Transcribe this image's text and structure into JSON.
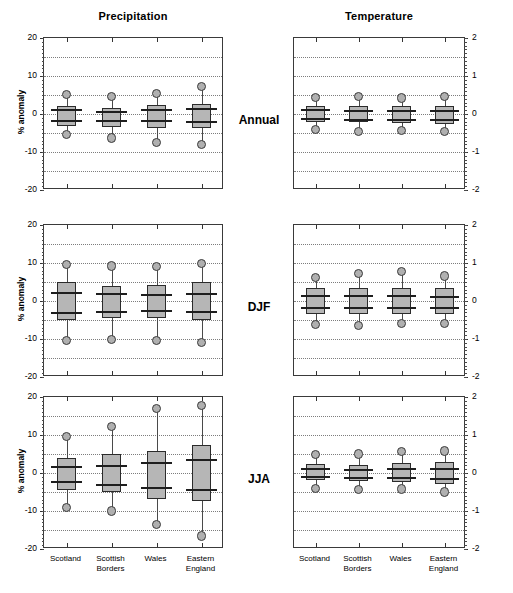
{
  "figure": {
    "columns": [
      {
        "key": "precipitation",
        "title": "Precipitation"
      },
      {
        "key": "temperature",
        "title": "Temperature"
      }
    ],
    "rows": [
      {
        "key": "annual",
        "label": "Annual"
      },
      {
        "key": "djf",
        "label": "DJF"
      },
      {
        "key": "jja",
        "label": "JJA"
      }
    ],
    "categories": [
      "Scotland",
      "Scottish\nBorders",
      "Wales",
      "Eastern\nEngland"
    ],
    "colors": {
      "box_fill": "#b6b6b6",
      "box_edge": "#2b2b2b",
      "bar": "#1e1e1e",
      "whisker": "#4a4a4a",
      "marker_fill": "#b0b0b0",
      "grid": "#7d7d7d",
      "frame": "#3a3a3a"
    }
  },
  "chart_data": [
    {
      "type": "box",
      "panel": "precipitation-annual",
      "title": "Precipitation",
      "row": "Annual",
      "ylabel": "% anomaly",
      "ylim": [
        -20,
        20
      ],
      "yticks": [
        20,
        10,
        0,
        -10,
        -20
      ],
      "ytick_labels": [
        "20",
        "10",
        "0",
        "-10",
        "-20"
      ],
      "gridlines": [
        15,
        10,
        5,
        0,
        -5,
        -10,
        -15
      ],
      "grid": true,
      "categories": [
        "Scotland",
        "Scottish Borders",
        "Wales",
        "Eastern England"
      ],
      "boxes": [
        {
          "category": "Scotland",
          "upper_cap": 5.2,
          "box_top": 2.1,
          "p_upper": 1.3,
          "p_lower": -1.5,
          "box_bottom": -3.2,
          "lower_cap": -5.3
        },
        {
          "category": "Scottish Borders",
          "upper_cap": 4.7,
          "box_top": 1.6,
          "p_upper": 0.9,
          "p_lower": -1.6,
          "box_bottom": -3.4,
          "lower_cap": -6.3
        },
        {
          "category": "Wales",
          "upper_cap": 5.4,
          "box_top": 2.5,
          "p_upper": 1.4,
          "p_lower": -1.6,
          "box_bottom": -3.6,
          "lower_cap": -7.6
        },
        {
          "category": "Eastern England",
          "upper_cap": 7.2,
          "box_top": 2.7,
          "p_upper": 1.6,
          "p_lower": -1.8,
          "box_bottom": -3.6,
          "lower_cap": -8.1
        }
      ]
    },
    {
      "type": "box",
      "panel": "temperature-annual",
      "title": "Temperature",
      "row": "Annual",
      "ylabel": "°C anomaly",
      "ylim": [
        -2,
        2
      ],
      "yticks": [
        2,
        1,
        0,
        -1,
        -2
      ],
      "ytick_labels": [
        "2",
        "1",
        "0",
        "-1",
        "-2"
      ],
      "gridlines": [
        1.5,
        1.0,
        0.5,
        0,
        -0.5,
        -1.0,
        -1.5
      ],
      "grid": true,
      "categories": [
        "Scotland",
        "Scottish Borders",
        "Wales",
        "Eastern England"
      ],
      "boxes": [
        {
          "category": "Scotland",
          "upper_cap": 0.43,
          "box_top": 0.22,
          "p_upper": 0.12,
          "p_lower": -0.1,
          "box_bottom": -0.2,
          "lower_cap": -0.4
        },
        {
          "category": "Scottish Borders",
          "upper_cap": 0.45,
          "box_top": 0.2,
          "p_upper": 0.1,
          "p_lower": -0.12,
          "box_bottom": -0.22,
          "lower_cap": -0.45
        },
        {
          "category": "Wales",
          "upper_cap": 0.42,
          "box_top": 0.2,
          "p_upper": 0.1,
          "p_lower": -0.12,
          "box_bottom": -0.23,
          "lower_cap": -0.43
        },
        {
          "category": "Eastern England",
          "upper_cap": 0.45,
          "box_top": 0.22,
          "p_upper": 0.1,
          "p_lower": -0.14,
          "box_bottom": -0.26,
          "lower_cap": -0.47
        }
      ]
    },
    {
      "type": "box",
      "panel": "precipitation-djf",
      "title": "Precipitation",
      "row": "DJF",
      "ylabel": "% anomaly",
      "ylim": [
        -20,
        20
      ],
      "yticks": [
        20,
        10,
        0,
        -10,
        -20
      ],
      "ytick_labels": [
        "20",
        "10",
        "0",
        "-10",
        "-20"
      ],
      "gridlines": [
        15,
        10,
        5,
        0,
        -5,
        -10,
        -15
      ],
      "grid": true,
      "categories": [
        "Scotland",
        "Scottish Borders",
        "Wales",
        "Eastern England"
      ],
      "boxes": [
        {
          "category": "Scotland",
          "upper_cap": 9.7,
          "box_top": 4.9,
          "p_upper": 2.4,
          "p_lower": -2.8,
          "box_bottom": -5.0,
          "lower_cap": -10.3
        },
        {
          "category": "Scottish Borders",
          "upper_cap": 9.2,
          "box_top": 3.9,
          "p_upper": 2.1,
          "p_lower": -2.5,
          "box_bottom": -4.6,
          "lower_cap": -10.2
        },
        {
          "category": "Wales",
          "upper_cap": 9.1,
          "box_top": 4.3,
          "p_upper": 1.9,
          "p_lower": -2.3,
          "box_bottom": -4.5,
          "lower_cap": -10.5
        },
        {
          "category": "Eastern England",
          "upper_cap": 9.8,
          "box_top": 5.0,
          "p_upper": 2.2,
          "p_lower": -2.7,
          "box_bottom": -4.9,
          "lower_cap": -10.9
        }
      ]
    },
    {
      "type": "box",
      "panel": "temperature-djf",
      "title": "Temperature",
      "row": "DJF",
      "ylabel": "°C anomaly",
      "ylim": [
        -2,
        2
      ],
      "yticks": [
        2,
        1,
        0,
        -1,
        -2
      ],
      "ytick_labels": [
        "2",
        "1",
        "0",
        "-1",
        "-2"
      ],
      "gridlines": [
        1.5,
        1.0,
        0.5,
        0,
        -0.5,
        -1.0,
        -1.5
      ],
      "grid": true,
      "categories": [
        "Scotland",
        "Scottish Borders",
        "Wales",
        "Eastern England"
      ],
      "boxes": [
        {
          "category": "Scotland",
          "upper_cap": 0.62,
          "box_top": 0.33,
          "p_upper": 0.17,
          "p_lower": -0.15,
          "box_bottom": -0.33,
          "lower_cap": -0.62
        },
        {
          "category": "Scottish Borders",
          "upper_cap": 0.72,
          "box_top": 0.34,
          "p_upper": 0.17,
          "p_lower": -0.16,
          "box_bottom": -0.34,
          "lower_cap": -0.64
        },
        {
          "category": "Wales",
          "upper_cap": 0.78,
          "box_top": 0.35,
          "p_upper": 0.16,
          "p_lower": -0.16,
          "box_bottom": -0.35,
          "lower_cap": -0.6
        },
        {
          "category": "Eastern England",
          "upper_cap": 0.66,
          "box_top": 0.33,
          "p_upper": 0.14,
          "p_lower": -0.17,
          "box_bottom": -0.34,
          "lower_cap": -0.6
        }
      ]
    },
    {
      "type": "box",
      "panel": "precipitation-jja",
      "title": "Precipitation",
      "row": "JJA",
      "ylabel": "% anomaly",
      "ylim": [
        -20,
        20
      ],
      "yticks": [
        20,
        10,
        0,
        -10,
        -20
      ],
      "ytick_labels": [
        "20",
        "10",
        "0",
        "-10",
        "-20"
      ],
      "gridlines": [
        15,
        10,
        5,
        0,
        -5,
        -10,
        -15
      ],
      "grid": true,
      "categories": [
        "Scotland",
        "Scottish Borders",
        "Wales",
        "Eastern England"
      ],
      "boxes": [
        {
          "category": "Scotland",
          "upper_cap": 9.5,
          "box_top": 4.0,
          "p_upper": 1.9,
          "p_lower": -2.1,
          "box_bottom": -4.5,
          "lower_cap": -9.0
        },
        {
          "category": "Scottish Borders",
          "upper_cap": 12.3,
          "box_top": 5.1,
          "p_upper": 2.0,
          "p_lower": -3.0,
          "box_bottom": -5.1,
          "lower_cap": -10.0
        },
        {
          "category": "Wales",
          "upper_cap": 17.0,
          "box_top": 5.9,
          "p_upper": 3.0,
          "p_lower": -3.6,
          "box_bottom": -6.9,
          "lower_cap": -13.5
        },
        {
          "category": "Eastern England",
          "upper_cap": 17.7,
          "box_top": 7.5,
          "p_upper": 3.8,
          "p_lower": -4.2,
          "box_bottom": -7.3,
          "lower_cap": -16.6
        }
      ]
    },
    {
      "type": "box",
      "panel": "temperature-jja",
      "title": "Temperature",
      "row": "JJA",
      "ylabel": "°C anomaly",
      "ylim": [
        -2,
        2
      ],
      "yticks": [
        2,
        1,
        0,
        -1,
        -2
      ],
      "ytick_labels": [
        "2",
        "1",
        "0",
        "-1",
        "-2"
      ],
      "gridlines": [
        1.5,
        1.0,
        0.5,
        0,
        -0.5,
        -1.0,
        -1.5
      ],
      "grid": true,
      "categories": [
        "Scotland",
        "Scottish Borders",
        "Wales",
        "Eastern England"
      ],
      "boxes": [
        {
          "category": "Scotland",
          "upper_cap": 0.48,
          "box_top": 0.23,
          "p_upper": 0.12,
          "p_lower": -0.08,
          "box_bottom": -0.19,
          "lower_cap": -0.4
        },
        {
          "category": "Scottish Borders",
          "upper_cap": 0.5,
          "box_top": 0.22,
          "p_upper": 0.11,
          "p_lower": -0.1,
          "box_bottom": -0.21,
          "lower_cap": -0.44
        },
        {
          "category": "Wales",
          "upper_cap": 0.57,
          "box_top": 0.26,
          "p_upper": 0.13,
          "p_lower": -0.11,
          "box_bottom": -0.23,
          "lower_cap": -0.42
        },
        {
          "category": "Eastern England",
          "upper_cap": 0.58,
          "box_top": 0.3,
          "p_upper": 0.14,
          "p_lower": -0.13,
          "box_bottom": -0.28,
          "lower_cap": -0.5
        }
      ]
    }
  ]
}
